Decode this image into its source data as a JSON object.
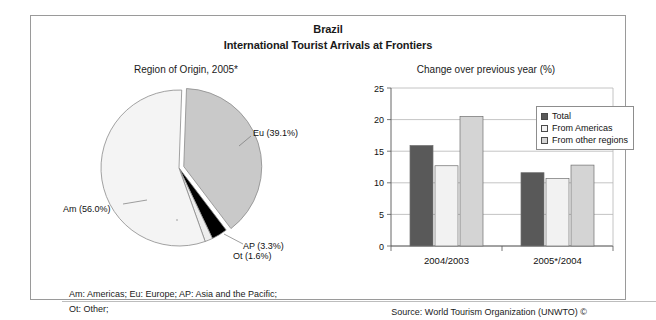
{
  "figure": {
    "title_main": "Brazil",
    "title_sub": "International Tourist Arrivals at Frontiers",
    "footnote_line1": "Am: Americas; Eu: Europe; AP: Asia and the Pacific;",
    "footnote_line2": "Ot: Other;",
    "source": "Source: World Tourism Organization (UNWTO) ©"
  },
  "pie_panel": {
    "subtitle": "Region of Origin, 2005*",
    "labels": {
      "eu": "Eu (39.1%)",
      "am": "Am (56.0%)",
      "ap": "AP (3.3%)",
      "ot": "Ot (1.6%)"
    }
  },
  "bar_panel": {
    "subtitle": "Change over previous year (%)",
    "legend": [
      {
        "label": "Total",
        "color": "#595959"
      },
      {
        "label": "From Americas",
        "color": "#f2f2f2"
      },
      {
        "label": "From other regions",
        "color": "#d4d4d4"
      }
    ]
  },
  "chart_data": [
    {
      "type": "pie",
      "title": "Region of Origin, 2005*",
      "labels": [
        "Am",
        "Eu",
        "AP",
        "Ot"
      ],
      "label_texts": [
        "Am (56.0%)",
        "Eu (39.1%)",
        "AP (3.3%)",
        "Ot (1.6%)"
      ],
      "values": [
        56.0,
        39.1,
        3.3,
        1.6
      ],
      "unit": "%",
      "colors": [
        "#f4f4f4",
        "#c9c9c9",
        "#000000",
        "#ededed"
      ],
      "exploded": [
        "Eu"
      ],
      "legend": "labels-outside"
    },
    {
      "type": "bar",
      "title": "Change over previous year (%)",
      "categories": [
        "2004/2003",
        "2005*/2004"
      ],
      "series": [
        {
          "name": "Total",
          "values": [
            15.9,
            11.6
          ],
          "color": "#595959"
        },
        {
          "name": "From Americas",
          "values": [
            12.7,
            10.7
          ],
          "color": "#f2f2f2"
        },
        {
          "name": "From other regions",
          "values": [
            20.5,
            12.8
          ],
          "color": "#d4d4d4"
        }
      ],
      "xlabel": "",
      "ylabel": "",
      "ylim": [
        0,
        25
      ],
      "yticks": [
        0,
        5,
        10,
        15,
        20,
        25
      ],
      "ytick_labels": [
        "0",
        "5",
        "10",
        "15",
        "20",
        "25"
      ],
      "grid": "horizontal",
      "legend_position": "top-right"
    }
  ]
}
